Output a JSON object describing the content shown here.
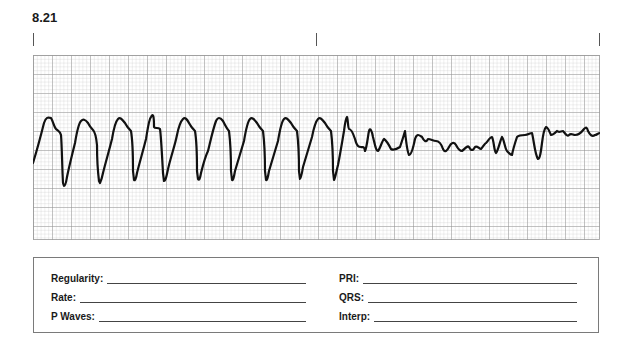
{
  "figure": {
    "number": "8.21"
  },
  "markers": {
    "count": 3,
    "positions_px": [
      33,
      316,
      599
    ]
  },
  "strip": {
    "grid": {
      "minor_px": 3.8,
      "major_px": 19,
      "minor_color": "#c8c8c8",
      "major_color": "#8e8e8e"
    },
    "trace_color": "#111111",
    "rhythm_description": "Wide regular monomorphic complexes transitioning to chaotic low-amplitude undulating baseline"
  },
  "form": {
    "left": [
      {
        "label": "Regularity:",
        "value": ""
      },
      {
        "label": "Rate:",
        "value": ""
      },
      {
        "label": "P Waves:",
        "value": ""
      }
    ],
    "right": [
      {
        "label": "PRI:",
        "value": ""
      },
      {
        "label": "QRS:",
        "value": ""
      },
      {
        "label": "Interp:",
        "value": ""
      }
    ]
  }
}
